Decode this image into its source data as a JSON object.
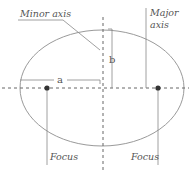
{
  "diagram": {
    "labels": {
      "minor_axis": "Minor axis",
      "major_axis_line1": "Major",
      "major_axis_line2": "axis",
      "semi_major": "a",
      "semi_minor": "b",
      "focus_left": "Focus",
      "focus_right": "Focus"
    },
    "colors": {
      "stroke": "#9a9a9a",
      "dash": "#666666",
      "focus": "#333333",
      "text": "#555555"
    }
  }
}
